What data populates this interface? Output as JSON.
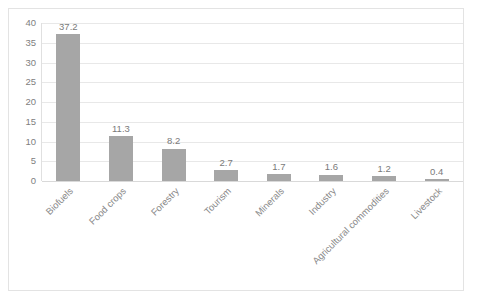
{
  "chart_data": {
    "type": "bar",
    "title": "",
    "subtitle": "",
    "xlabel": "",
    "ylabel": "",
    "categories": [
      "Biofuels",
      "Food crops",
      "Forestry",
      "Tourism",
      "Minerals",
      "Industry",
      "Agricultural commodities",
      "Livestock"
    ],
    "values": [
      37.2,
      11.3,
      8.2,
      2.7,
      1.7,
      1.6,
      1.2,
      0.4
    ],
    "data_labels": [
      "37.2",
      "11.3",
      "8.2",
      "2.7",
      "1.7",
      "1.6",
      "1.2",
      "0.4"
    ],
    "ylim": [
      0,
      40
    ],
    "yticks": [
      0,
      5,
      10,
      15,
      20,
      25,
      30,
      35,
      40
    ],
    "ytick_labels": [
      "0",
      "5",
      "10",
      "15",
      "20",
      "25",
      "30",
      "35",
      "40"
    ],
    "grid": "horizontal",
    "legend": "none",
    "bar_color": "#a6a6a6",
    "gridline_color": "#e8e8e8",
    "text_color": "#808080",
    "xtick_rotation": "-45"
  }
}
